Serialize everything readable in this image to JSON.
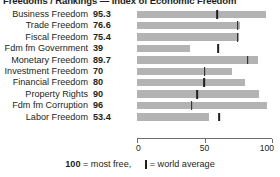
{
  "title": "Freedoms / Rankings — Index of Economic Freedom",
  "legend": {
    "most_free_number": "100",
    "most_free_text": "= most free,",
    "world_average_text": "= world average",
    "marker_glyph": "vertical-bar-marker"
  },
  "axis": {
    "ticks": [
      0,
      50,
      100
    ],
    "tick_labels": [
      "0",
      "50",
      "100"
    ],
    "min": 0,
    "max": 100
  },
  "colors": {
    "bar": "#b3b3b3",
    "marker": "#231f20",
    "text": "#231f20",
    "axis": "#6d6e71",
    "background": "#ffffff"
  },
  "chart_data": {
    "type": "bar",
    "title": "Freedoms / Rankings — Index of Economic Freedom",
    "xlabel": "",
    "ylabel": "",
    "xlim": [
      0,
      100
    ],
    "grid": false,
    "legend_position": "bottom",
    "orientation": "horizontal",
    "categories": [
      "Business Freedom",
      "Trade Freedom",
      "Fiscal Freedom",
      "Fdm fm Government",
      "Monetary Freedom",
      "Investment Freedom",
      "Financial Freedom",
      "Property Rights",
      "Fdm fm Corruption",
      "Labor Freedom"
    ],
    "values": [
      95.3,
      76.6,
      75.4,
      39,
      89.7,
      70,
      80,
      90,
      96,
      53.4
    ],
    "value_labels": [
      "95.3",
      "76.6",
      "75.4",
      "39",
      "89.7",
      "70",
      "80",
      "90",
      "96",
      "53.4"
    ],
    "series": [
      {
        "name": "Country score",
        "values": [
          95.3,
          76.6,
          75.4,
          39,
          89.7,
          70,
          80,
          90,
          96,
          53.4
        ]
      },
      {
        "name": "World average",
        "values": [
          59.5,
          74.5,
          74.5,
          60.0,
          82.0,
          50.0,
          49.5,
          44.5,
          40.5,
          61.0
        ]
      }
    ],
    "rows": [
      {
        "label": "Business Freedom",
        "value": 95.3,
        "value_label": "95.3",
        "world_average": 59.5
      },
      {
        "label": "Trade Freedom",
        "value": 76.6,
        "value_label": "76.6",
        "world_average": 74.5
      },
      {
        "label": "Fiscal Freedom",
        "value": 75.4,
        "value_label": "75.4",
        "world_average": 74.5
      },
      {
        "label": "Fdm fm Government",
        "value": 39,
        "value_label": "39",
        "world_average": 60.0
      },
      {
        "label": "Monetary Freedom",
        "value": 89.7,
        "value_label": "89.7",
        "world_average": 82.0
      },
      {
        "label": "Investment Freedom",
        "value": 70,
        "value_label": "70",
        "world_average": 50.0
      },
      {
        "label": "Financial Freedom",
        "value": 80,
        "value_label": "80",
        "world_average": 49.5
      },
      {
        "label": "Property Rights",
        "value": 90,
        "value_label": "90",
        "world_average": 44.5
      },
      {
        "label": "Fdm fm Corruption",
        "value": 96,
        "value_label": "96",
        "world_average": 40.5
      },
      {
        "label": "Labor Freedom",
        "value": 53.4,
        "value_label": "53.4",
        "world_average": 61.0
      }
    ]
  }
}
